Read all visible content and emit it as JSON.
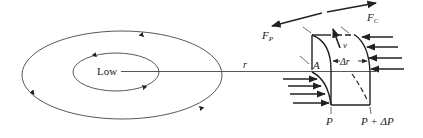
{
  "diagram": {
    "type": "force-balance-around-low-pressure",
    "colors": {
      "background": "#ffffff",
      "stroke": "#222222",
      "thin_stroke": "#444444"
    },
    "center_label": "Low",
    "radius_label": "r",
    "isobars": [
      {
        "name": "inner-isobar",
        "flow": "counterclockwise"
      },
      {
        "name": "outer-isobar",
        "flow": "counterclockwise"
      }
    ],
    "parcel": {
      "area_label": "A",
      "width_label": "Δr",
      "velocity_label": "v",
      "inner_pressure_label": "P",
      "outer_pressure_label": "P + ΔP"
    },
    "forces": {
      "pressure_force_label": "F",
      "pressure_force_sub": "P",
      "centrifugal_force_label": "F",
      "centrifugal_force_sub": "C"
    }
  }
}
